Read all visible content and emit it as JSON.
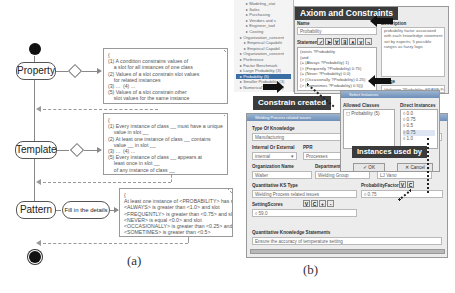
{
  "panel_a": {
    "caption": "(a)",
    "states": {
      "property": "Property",
      "template": "Template",
      "pattern": "Pattern",
      "fill_details": "Fill in the details"
    },
    "notes": {
      "property": "{\n(1) A condition constrains values of\n    a slot for all instances of one class\n(2) Values of a slot constrain slot values\n    for related instances\n(3) ...  (4) ...\n(5) Values of a slot constrain other\n    slot values for the same instance\n}",
      "template": "{\n(1) Every instance of class __ must have a unique\n    value in slot __\n(2) At least one instance of class __ contains\n    value __ in slot __\n(3) ...  (4) ...\n(5) Every instance of class __ appears at\n    least once in slot __\n    of any instance of class __\n}",
      "pattern": "{\nAt least one instance of <PROBABILITY> has slot\n<ALWAYS> is greater than <1.0> and slot\n<FREQUENTLY> is greater than <0.75> and slot\n<NEVER> is equal <0.0> and slot\n<OCCASIONALLY> is greater than <0.25> and slot\n<SOMETIMES> is greater than <0.5>\n}"
    }
  },
  "panel_b": {
    "caption": "(b)",
    "tree_items": [
      "Modeling_stat",
      "Sales",
      "Purchasing",
      "Vendors and s",
      "Engineer_tool",
      "Costing",
      "Organization_concent",
      "Empirical Capabilit",
      "Empirical Capabil",
      "Organization_concent",
      "Preference",
      "Factor Benchmark",
      "Large Probability (3)",
      "Probability (5)",
      "Smaller Probability (3)",
      "NumericalTradeoff (1)",
      "FieldTarget (1)"
    ],
    "tree_selected_index": 13,
    "axiom_window": {
      "banner": "Axiom and Constraints",
      "name_label": "Name",
      "name_value": "Probability",
      "statement_label": "Statement",
      "toolbar_icons": [
        "check",
        "forward",
        "for-all",
        "exists",
        "and",
        "or",
        "not"
      ],
      "statement_lines": [
        "(exists ?Probability",
        "   (and",
        "      (= (Always ?Probability) 1)",
        "      (> (Frequently ?Probability) 0.75)",
        "      (= (Never ?Probability) 0.0)",
        "      (> (Occasionally ?Probability) 0.25)",
        "      (> (Sometimes ?Probability) 0.5)))"
      ],
      "description_label": "Description",
      "description_value": "probability factor associated with each knowledge statement set by experts; 5 possible ranges as fuzzy logic",
      "range_label": "Range",
      "range_value": "(defrange ?Probability :FRAME Probability)"
    },
    "constrain_label": "Constrain created",
    "instances_label": "Instances used by",
    "select_window": {
      "title": "Select Instances",
      "allowed_header": "Allowed Classes",
      "allowed_items": [
        "Probability (5)"
      ],
      "direct_header": "Direct Instances",
      "direct_items": [
        "0.0",
        "0.75",
        "0.5",
        "0.75",
        "1.0"
      ],
      "highlighted_index": 3,
      "ok_label": "OK",
      "cancel_label": "Cancel"
    },
    "form_window": {
      "title": "Welding Process related issues",
      "type_label": "Type Of Knowledge",
      "type_value": "Manufacturing",
      "internal_label": "Internal Or External",
      "internal_value": "internal",
      "pps_label": "PPR",
      "pps_value": "Processes",
      "org_label": "Organization Name",
      "org_value": "Walter",
      "dept_label": "Department",
      "dept_value": "Welding Group",
      "owner_label": "Owner Of Knowledge",
      "owner_value": "LJ Vano",
      "ks_type_label": "Quantitative KS Type",
      "ks_type_value": "Welding Process related issues",
      "prob_label": "ProbabilityFactor",
      "prob_value": "0.75",
      "setting_label": "SettingScores",
      "setting_value": "59.0",
      "vc_buttons": [
        "V",
        "C",
        "+",
        "-"
      ],
      "statements_label": "Quantitative Knowledge Statements",
      "statements_value": "Ensure the accuracy of temperature setting"
    }
  }
}
